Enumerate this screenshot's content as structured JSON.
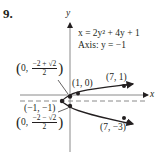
{
  "problem_number": "9.",
  "equation": {
    "line1": "x = 2y² + 4y + 1",
    "line2": "Axis: y = −1"
  },
  "axes": {
    "x_label": "x",
    "y_label": "y"
  },
  "points": {
    "upper_y_intercept": {
      "prefix": "0,",
      "numerator": "−2 + √2",
      "denominator": "2"
    },
    "x_intercept": "(1, 0)",
    "upper_point": "(7, 1)",
    "vertex": "(−1, −1)",
    "lower_y_intercept": {
      "prefix": "0,",
      "numerator": "−2 − √2",
      "denominator": "2"
    },
    "lower_point": "(7, −3)"
  },
  "colors": {
    "ink": "#231f20",
    "axis": "#8a8a8a",
    "background": "#ffffff"
  }
}
